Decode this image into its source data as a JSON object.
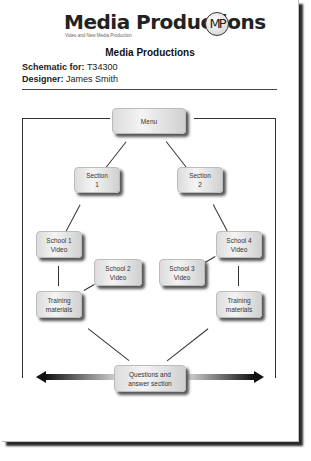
{
  "header": {
    "logo_text": "Media Productions",
    "logo_tagline": "Video and New Media Production",
    "logo_mark": "MP",
    "title": "Media Productions"
  },
  "meta": {
    "schematic_label": "Schematic for:",
    "schematic_value": "T34300",
    "designer_label": "Designer:",
    "designer_value": "James Smith"
  },
  "diagram": {
    "nodes": {
      "menu": [
        "Menu"
      ],
      "section1": [
        "Section",
        "1"
      ],
      "section2": [
        "Section",
        "2"
      ],
      "school1": [
        "School 1",
        "Video"
      ],
      "school2": [
        "School 2",
        "Video"
      ],
      "school3": [
        "School 3",
        "Video"
      ],
      "school4": [
        "School 4",
        "Video"
      ],
      "training_left": [
        "Training",
        "materials"
      ],
      "training_right": [
        "Training",
        "materials"
      ],
      "qa": [
        "Questions and",
        "answer section"
      ]
    },
    "arrow": "bidirectional-arrow"
  }
}
